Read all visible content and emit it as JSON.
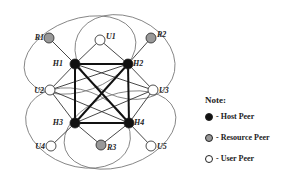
{
  "colors": {
    "host": "#111111",
    "resource": "#999999",
    "user": "#ffffff",
    "edge": "#333333",
    "cluster": "#777777"
  },
  "nodes": [
    {
      "id": "H1",
      "type": "host"
    },
    {
      "id": "H2",
      "type": "host"
    },
    {
      "id": "H3",
      "type": "host"
    },
    {
      "id": "H4",
      "type": "host"
    },
    {
      "id": "R1",
      "type": "resource"
    },
    {
      "id": "R2",
      "type": "resource"
    },
    {
      "id": "R3",
      "type": "resource"
    },
    {
      "id": "U1",
      "type": "user"
    },
    {
      "id": "U2",
      "type": "user"
    },
    {
      "id": "U3",
      "type": "user"
    },
    {
      "id": "U4",
      "type": "user"
    },
    {
      "id": "U5",
      "type": "user"
    }
  ],
  "host_edges": [
    [
      "H1",
      "H2"
    ],
    [
      "H1",
      "H3"
    ],
    [
      "H2",
      "H4"
    ],
    [
      "H3",
      "H4"
    ],
    [
      "H1",
      "H4"
    ],
    [
      "H2",
      "H3"
    ]
  ],
  "peer_edges": [
    [
      "H1",
      "R1"
    ],
    [
      "H1",
      "U1"
    ],
    [
      "H1",
      "U2"
    ],
    [
      "H1",
      "U3"
    ],
    [
      "H2",
      "R2"
    ],
    [
      "H2",
      "U1"
    ],
    [
      "H2",
      "U2"
    ],
    [
      "H2",
      "U3"
    ],
    [
      "H3",
      "U2"
    ],
    [
      "H3",
      "U4"
    ],
    [
      "H3",
      "R3"
    ],
    [
      "H3",
      "U3"
    ],
    [
      "H4",
      "U3"
    ],
    [
      "H4",
      "U5"
    ],
    [
      "H4",
      "R3"
    ],
    [
      "H4",
      "U2"
    ]
  ],
  "clusters": [
    "H1",
    "H2",
    "H3",
    "H4"
  ],
  "legend": {
    "title": "Note:",
    "items": [
      {
        "type": "host",
        "label": "- Host Peer"
      },
      {
        "type": "resource",
        "label": "- Resource Peer"
      },
      {
        "type": "user",
        "label": "- User Peer"
      }
    ]
  }
}
